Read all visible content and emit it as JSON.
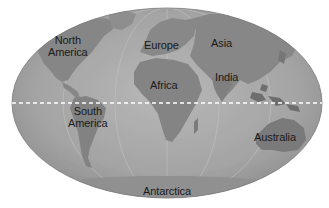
{
  "map": {
    "projection": "elliptical world map",
    "colors": {
      "ocean": "#a9a9a9",
      "land": "#8a8a8a",
      "land_dark": "#6e6e6e",
      "equator": "#ffffff",
      "label": "#1a1a1a",
      "background": "#ffffff"
    },
    "labels": {
      "north_america": "North\nAmerica",
      "north_america_l1": "North",
      "north_america_l2": "America",
      "europe": "Europe",
      "asia": "Asia",
      "africa": "Africa",
      "india": "India",
      "south_america_l1": "South",
      "south_america_l2": "America",
      "australia": "Australia",
      "antarctica": "Antarctica"
    },
    "equator": {
      "style": "dashed",
      "color": "#ffffff"
    }
  }
}
